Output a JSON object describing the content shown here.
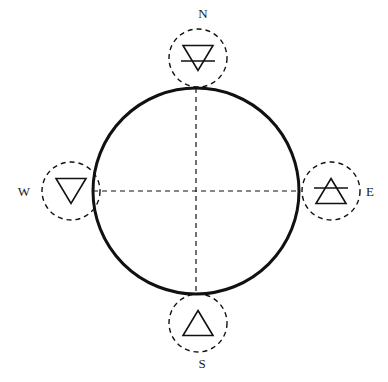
{
  "diagram": {
    "type": "compass-element-wheel",
    "background_color": "#ffffff",
    "stroke_color": "#111111",
    "main_circle": {
      "name": "main-circle",
      "center_x": 196,
      "center_y": 191,
      "radius": 103,
      "stroke_width": 3,
      "style": "solid",
      "fill": "none"
    },
    "axes": [
      {
        "name": "vertical-axis",
        "orientation": "vertical",
        "x1": 196,
        "y1": 88,
        "x2": 196,
        "y2": 294,
        "style": "dashed",
        "stroke_width": 1.2,
        "dash_pattern": "5,4"
      },
      {
        "name": "horizontal-axis",
        "orientation": "horizontal",
        "x1": 93,
        "y1": 191,
        "x2": 299,
        "y2": 191,
        "style": "dashed",
        "stroke_width": 1.2,
        "dash_pattern": "5,4"
      }
    ],
    "nodes": [
      {
        "id": "north",
        "direction_label": "N",
        "element": "earth",
        "symbol_name": "earth-symbol",
        "symbol_unicode": "🜃",
        "symbol_description": "downward triangle with horizontal bar",
        "triangle_direction": "down",
        "has_bar": true,
        "circle_center_x": 198,
        "circle_center_y": 58,
        "circle_radius": 29,
        "label_x": 203,
        "label_y": 18,
        "label_anchor": "middle"
      },
      {
        "id": "east",
        "direction_label": "E",
        "element": "air",
        "symbol_name": "air-symbol",
        "symbol_unicode": "🜁",
        "symbol_description": "upward triangle with horizontal bar",
        "triangle_direction": "up",
        "has_bar": true,
        "circle_center_x": 331,
        "circle_center_y": 191,
        "circle_radius": 29,
        "label_x": 370,
        "label_y": 196,
        "label_anchor": "middle"
      },
      {
        "id": "south",
        "direction_label": "S",
        "element": "fire",
        "symbol_name": "fire-symbol",
        "symbol_unicode": "🜂",
        "symbol_description": "upward triangle",
        "triangle_direction": "up",
        "has_bar": false,
        "circle_center_x": 198,
        "circle_center_y": 323,
        "circle_radius": 29,
        "label_x": 202,
        "label_y": 368,
        "label_anchor": "middle"
      },
      {
        "id": "west",
        "direction_label": "W",
        "element": "water",
        "symbol_name": "water-symbol",
        "symbol_unicode": "🜄",
        "symbol_description": "downward triangle",
        "triangle_direction": "down",
        "has_bar": false,
        "circle_center_x": 71,
        "circle_center_y": 191,
        "circle_radius": 29,
        "label_x": 24,
        "label_y": 196,
        "label_anchor": "middle"
      }
    ],
    "node_circle_style": {
      "style": "dashed",
      "stroke_width": 1.4,
      "dash_pattern": "5,4",
      "fill": "none"
    },
    "glyph_style": {
      "stroke_width": 1.6,
      "triangle_half_width": 15,
      "triangle_height": 25,
      "bar_half_width": 17
    }
  }
}
